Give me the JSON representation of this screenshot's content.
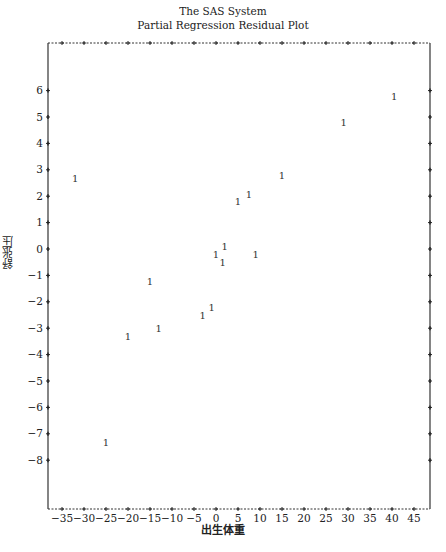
{
  "header": {
    "system_title": "The SAS System",
    "plot_title": "Partial Regression Residual Plot"
  },
  "chart_data": {
    "type": "scatter",
    "title": "Partial Regression Residual Plot",
    "subtitle": "The SAS System",
    "xlabel": "出生体重",
    "ylabel": "舒张压",
    "marker": "1",
    "xlim": [
      -37,
      46
    ],
    "ylim": [
      -10,
      7.5
    ],
    "xticks": [
      -35,
      -30,
      -25,
      -20,
      -15,
      -10,
      -5,
      0,
      5,
      10,
      15,
      20,
      25,
      30,
      35,
      40,
      45
    ],
    "yticks": [
      6,
      5,
      4,
      3,
      2,
      1,
      0,
      -1,
      -2,
      -3,
      -4,
      -5,
      -6,
      -7,
      -8
    ],
    "grid": false,
    "legend": null,
    "points": [
      {
        "x": -32,
        "y": 2.7
      },
      {
        "x": -15,
        "y": -1.2
      },
      {
        "x": -25,
        "y": -7.3
      },
      {
        "x": -20,
        "y": -3.3
      },
      {
        "x": -13,
        "y": -3.0
      },
      {
        "x": -3,
        "y": -2.5
      },
      {
        "x": -1,
        "y": -2.2
      },
      {
        "x": 0,
        "y": -0.2
      },
      {
        "x": 1.5,
        "y": -0.5
      },
      {
        "x": 2,
        "y": 0.1
      },
      {
        "x": 9,
        "y": -0.2
      },
      {
        "x": 5,
        "y": 1.8
      },
      {
        "x": 7.5,
        "y": 2.1
      },
      {
        "x": 15,
        "y": 2.8
      },
      {
        "x": 29,
        "y": 4.8
      },
      {
        "x": 40.5,
        "y": 5.8
      }
    ]
  }
}
